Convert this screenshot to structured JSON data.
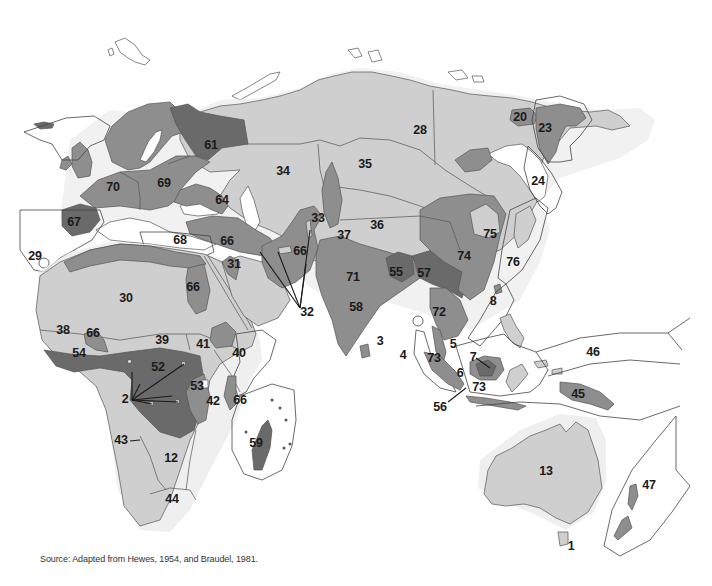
{
  "map": {
    "title": "Old World regions (numbered)",
    "shading": {
      "sea": "#ffffff",
      "light": "#cfcfcf",
      "medium": "#8e8e8e",
      "dark": "#6a6a6a",
      "halo": "#e8e8e8",
      "label": "#1a1a1a"
    },
    "labels": {
      "l1": "1",
      "l2": "2",
      "l3": "3",
      "l4": "4",
      "l5": "5",
      "l6": "6",
      "l7": "7",
      "l8": "8",
      "l12": "12",
      "l13": "13",
      "l20": "20",
      "l23": "23",
      "l24": "24",
      "l28": "28",
      "l29": "29",
      "l30": "30",
      "l31": "31",
      "l32": "32",
      "l33": "33",
      "l34": "34",
      "l35": "35",
      "l36": "36",
      "l37": "37",
      "l38": "38",
      "l39": "39",
      "l40": "40",
      "l41": "41",
      "l42": "42",
      "l43": "43",
      "l44": "44",
      "l45": "45",
      "l46": "46",
      "l47": "47",
      "l52": "52",
      "l53": "53",
      "l54": "54",
      "l55": "55",
      "l56": "56",
      "l57": "57",
      "l58": "58",
      "l59": "59",
      "l61": "61",
      "l64": "64",
      "l66a": "66",
      "l66b": "66",
      "l66c": "66",
      "l66d": "66",
      "l66e": "66",
      "l67": "67",
      "l68": "68",
      "l69": "69",
      "l70": "70",
      "l71": "71",
      "l72": "72",
      "l73a": "73",
      "l73b": "73",
      "l74": "74",
      "l75": "75",
      "l76": "76"
    },
    "source": "Source: Adapted from Hewes, 1954, and Braudel, 1981."
  }
}
